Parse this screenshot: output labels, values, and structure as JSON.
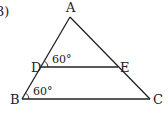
{
  "problem": {
    "number": "3)"
  },
  "figure": {
    "type": "triangle-with-parallel-segment",
    "points": {
      "A": "A",
      "B": "B",
      "C": "C",
      "D": "D",
      "E": "E"
    },
    "angles": {
      "ADE": "60°",
      "ABC": "60°"
    },
    "stroke_color": "#222222"
  }
}
